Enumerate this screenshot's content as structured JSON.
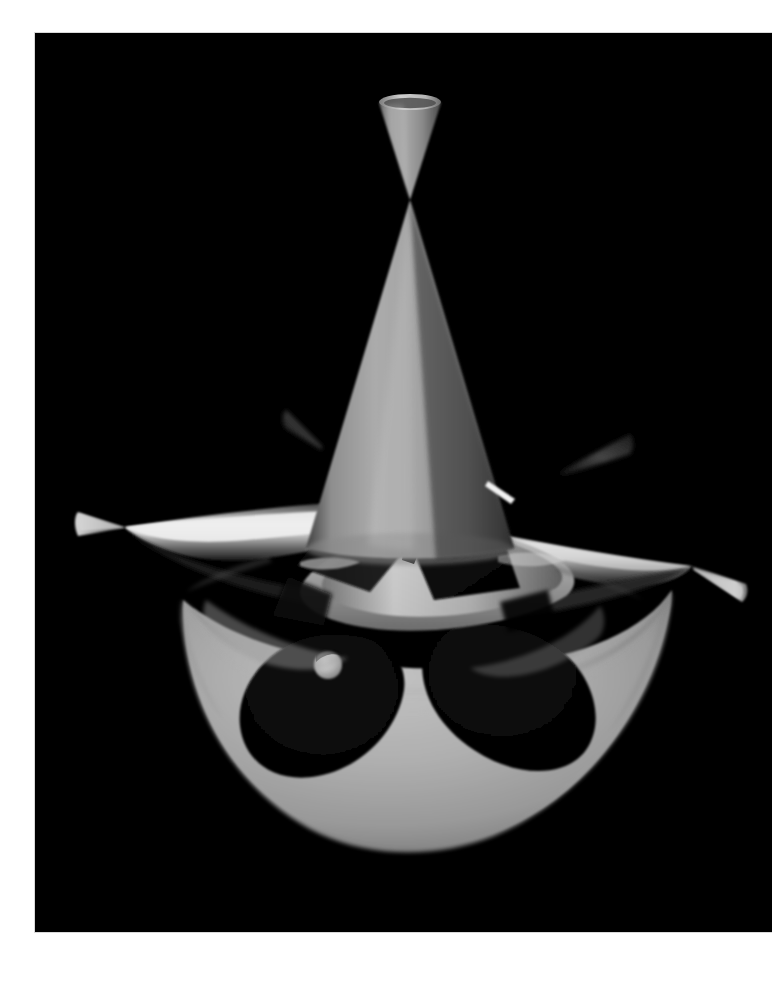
{
  "page": {
    "background_color": "#ffffff",
    "width": 772,
    "height": 981
  },
  "panel": {
    "background_color": "#000000",
    "left": 35,
    "top": 33,
    "width": 737,
    "height": 899,
    "border_color": "#d8d8d8"
  },
  "figure": {
    "name": "nodal-algebraic-surface",
    "render_style": "raytraced-grayscale",
    "surface_colors": {
      "highlight": "#f2f2f2",
      "bright": "#c9c9c9",
      "mid": "#9a9a9a",
      "mid_dark": "#6e6e6e",
      "dark": "#3a3a3a",
      "shadow": "#1a1a1a",
      "void": "#000000"
    },
    "features": [
      {
        "name": "top-spike-cone",
        "kind": "cone",
        "apex_x": 410,
        "apex_y": 200,
        "rim_y": 100,
        "rim_rx": 32,
        "rim_ry": 9,
        "shade": "#8e8e8e"
      },
      {
        "name": "main-central-cone",
        "kind": "cone",
        "apex_x": 410,
        "apex_y": 200,
        "base_y": 545,
        "base_half_width": 105,
        "shade": "#9e9e9e"
      },
      {
        "name": "left-spike-cone",
        "kind": "cone",
        "node_x": 124,
        "node_y": 527,
        "tip_x": 78,
        "tip_y": 512,
        "shade": "#b5b5b5"
      },
      {
        "name": "left-arm-wing",
        "kind": "wing",
        "node_x": 124,
        "node_y": 527,
        "inner_x": 330,
        "inner_y": 560,
        "shade": "#d0d0d0"
      },
      {
        "name": "right-spike-cone",
        "kind": "cone",
        "node_x": 692,
        "node_y": 566,
        "tip_x": 746,
        "tip_y": 590,
        "shade": "#bdbdbd"
      },
      {
        "name": "right-arm-wing",
        "kind": "wing",
        "node_x": 692,
        "node_y": 566,
        "inner_x": 500,
        "inner_y": 545,
        "shade": "#cfcfcf"
      },
      {
        "name": "upper-left-small-spike",
        "kind": "cone",
        "node_x": 318,
        "node_y": 440,
        "tip_x": 286,
        "tip_y": 412,
        "shade": "#2e2e2e"
      },
      {
        "name": "upper-right-small-spike",
        "kind": "cone",
        "node_x": 560,
        "node_y": 470,
        "tip_x": 628,
        "tip_y": 436,
        "shade": "#4a4a4a"
      },
      {
        "name": "lower-lobe-cup",
        "kind": "cup",
        "left_x": 182,
        "right_x": 672,
        "top_y": 600,
        "bottom_y": 848,
        "shade": "#a9a9a9"
      },
      {
        "name": "lower-lobe-left-hole",
        "kind": "hole",
        "cx": 318,
        "cy": 700,
        "rx": 72,
        "ry": 60,
        "shade": "#060606"
      },
      {
        "name": "lower-lobe-right-hole",
        "kind": "hole",
        "cx": 506,
        "cy": 700,
        "rx": 82,
        "ry": 62,
        "shade": "#050505"
      },
      {
        "name": "bright-crescent-dot",
        "kind": "highlight",
        "cx": 328,
        "cy": 665,
        "r": 13,
        "shade": "#c6c6c6"
      },
      {
        "name": "thin-white-streak",
        "kind": "specular-streak",
        "x1": 490,
        "y1": 482,
        "x2": 513,
        "y2": 498,
        "shade": "#f0f0f0"
      },
      {
        "name": "center-saddle-node",
        "kind": "node",
        "x": 410,
        "y": 555,
        "shade": "#111111"
      }
    ],
    "symmetry": "5-fold-like radial arrangement of spikes about vertical axis"
  }
}
